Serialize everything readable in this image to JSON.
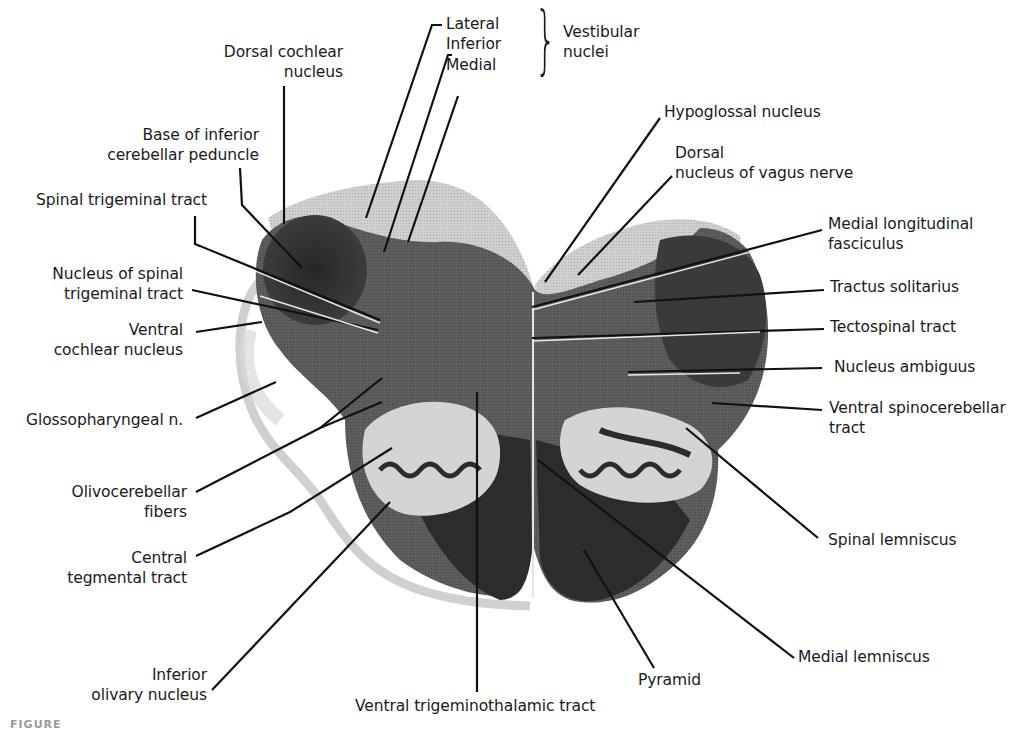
{
  "figure": {
    "caption_fragment": "FIGURE"
  },
  "colors": {
    "background": "#ffffff",
    "tissue_dark": "#2e2e2e",
    "tissue_mid": "#6b6b6b",
    "tissue_light": "#c9c9c9",
    "leader_line": "#111111",
    "text": "#1a1a1a"
  },
  "labels": {
    "vestibular_group": {
      "lateral": "Lateral",
      "inferior": "Inferior",
      "medial": "Medial",
      "group_line1": "Vestibular",
      "group_line2": "nuclei"
    },
    "left": {
      "dorsal_cochlear": [
        "Dorsal cochlear",
        "nucleus"
      ],
      "base_icp": [
        "Base of inferior",
        "cerebellar peduncle"
      ],
      "spinal_trig_tract": [
        "Spinal trigeminal tract"
      ],
      "nuc_spinal_trig": [
        "Nucleus of spinal",
        "trigeminal tract"
      ],
      "ventral_cochlear": [
        "Ventral",
        "cochlear nucleus"
      ],
      "glossopharyngeal": [
        "Glossopharyngeal n."
      ],
      "olivocerebellar": [
        "Olivocerebellar",
        "fibers"
      ],
      "central_tegmental": [
        "Central",
        "tegmental tract"
      ],
      "inferior_olivary": [
        "Inferior",
        "olivary nucleus"
      ]
    },
    "right": {
      "hypoglossal": [
        "Hypoglossal nucleus"
      ],
      "dorsal_vagus": [
        "Dorsal",
        "nucleus of vagus nerve"
      ],
      "mlf": [
        "Medial longitudinal",
        "fasciculus"
      ],
      "tractus_solitarius": [
        "Tractus solitarius"
      ],
      "tectospinal": [
        "Tectospinal tract"
      ],
      "nucleus_ambiguus": [
        "Nucleus ambiguus"
      ],
      "ventral_spinocerebellar": [
        "Ventral spinocerebellar",
        "tract"
      ],
      "spinal_lemniscus": [
        "Spinal lemniscus"
      ],
      "medial_lemniscus": [
        "Medial lemniscus"
      ],
      "pyramid": [
        "Pyramid"
      ]
    },
    "bottom": {
      "ventral_trigeminothalamic": [
        "Ventral trigeminothalamic tract"
      ]
    }
  }
}
